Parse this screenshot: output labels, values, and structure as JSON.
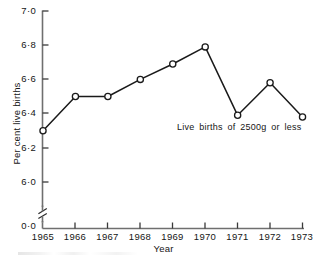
{
  "chart_data": {
    "type": "line",
    "title": "",
    "subtitle": "",
    "xlabel": "Year",
    "ylabel": "Per cent live births",
    "x": [
      1965,
      1966,
      1967,
      1968,
      1969,
      1970,
      1971,
      1972,
      1973
    ],
    "categories": [
      "1965",
      "1966",
      "1967",
      "1968",
      "1969",
      "1970",
      "1971",
      "1972",
      "1973"
    ],
    "values": [
      6.3,
      6.5,
      6.5,
      6.6,
      6.69,
      6.79,
      6.39,
      6.58,
      6.38
    ],
    "series": [
      {
        "name": "Live births of 2500g or less",
        "values": [
          6.3,
          6.5,
          6.5,
          6.6,
          6.69,
          6.79,
          6.39,
          6.58,
          6.38
        ],
        "marker": "open-circle",
        "line_color": "#1a1a1a",
        "marker_fill": "#ffffff"
      }
    ],
    "annotations": [
      {
        "text": "Live births of 2500g or less",
        "x": 1971,
        "y": 6.32
      }
    ],
    "xlim": [
      1965,
      1973
    ],
    "ylim": [
      6.0,
      7.0
    ],
    "ytick_labels": [
      "7·0",
      "6·8",
      "6·6",
      "6·4",
      "6·2",
      "6·0",
      "0·0"
    ],
    "ytick_values": [
      7.0,
      6.8,
      6.6,
      6.4,
      6.2,
      6.0,
      0.0
    ],
    "xtick_labels": [
      "1965",
      "1966",
      "1967",
      "1968",
      "1969",
      "1970",
      "1971",
      "1972",
      "1973"
    ],
    "axis_break": true,
    "axis_break_label": "y-axis-break",
    "grid": false,
    "legend": false,
    "legend_position": "none",
    "decimal_separator": "middle-dot",
    "accent_color": "#1a1a1a",
    "background_color": "#ffffff"
  },
  "axes": {
    "y_title": "Per cent live births",
    "x_title": "Year"
  }
}
